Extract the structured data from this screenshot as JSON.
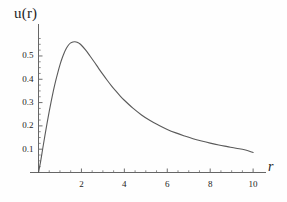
{
  "chart_data": {
    "type": "line",
    "title": "",
    "subtitle": "",
    "xlabel": "r",
    "ylabel": "u(r)",
    "grid": false,
    "legend": null,
    "xlim": [
      0,
      10.6
    ],
    "ylim": [
      0,
      0.62
    ],
    "xticks": [
      2,
      4,
      6,
      8,
      10
    ],
    "xtick_labels": [
      "2",
      "4",
      "6",
      "8",
      "10"
    ],
    "yticks": [
      0.1,
      0.2,
      0.3,
      0.4,
      0.5
    ],
    "ytick_labels": [
      "0.1",
      "0.2",
      "0.3",
      "0.4",
      "0.5"
    ],
    "x_minor_tick_step": 0.5,
    "y_minor_tick_step": 0.025,
    "line_color": "#555555",
    "axis_color": "#555555",
    "series": [
      {
        "name": "u(r)",
        "x": [
          0.0,
          0.1,
          0.2,
          0.3,
          0.4,
          0.5,
          0.6,
          0.7,
          0.8,
          0.9,
          1.0,
          1.1,
          1.2,
          1.3,
          1.4,
          1.5,
          1.6,
          1.7,
          1.8,
          1.9,
          2.0,
          2.2,
          2.4,
          2.6,
          2.8,
          3.0,
          3.2,
          3.4,
          3.6,
          3.8,
          4.0,
          4.4,
          4.8,
          5.2,
          5.6,
          6.0,
          6.4,
          6.8,
          7.2,
          7.6,
          8.0,
          8.4,
          8.8,
          9.2,
          9.6,
          10.0
        ],
        "y": [
          0.0,
          0.048,
          0.104,
          0.159,
          0.212,
          0.262,
          0.309,
          0.353,
          0.393,
          0.429,
          0.462,
          0.49,
          0.514,
          0.533,
          0.547,
          0.556,
          0.56,
          0.561,
          0.559,
          0.554,
          0.546,
          0.525,
          0.5,
          0.474,
          0.447,
          0.421,
          0.396,
          0.372,
          0.35,
          0.329,
          0.31,
          0.276,
          0.247,
          0.223,
          0.203,
          0.185,
          0.17,
          0.157,
          0.145,
          0.135,
          0.126,
          0.118,
          0.111,
          0.104,
          0.098,
          0.086
        ]
      }
    ],
    "peak": {
      "x": 1.75,
      "y": 0.561
    },
    "endpoint": {
      "x": 10.0,
      "y": 0.086
    },
    "origin": {
      "x": 0.0,
      "y": 0.0
    }
  },
  "axes": {
    "y_axis_label": "u(r)",
    "x_axis_label": "r"
  }
}
